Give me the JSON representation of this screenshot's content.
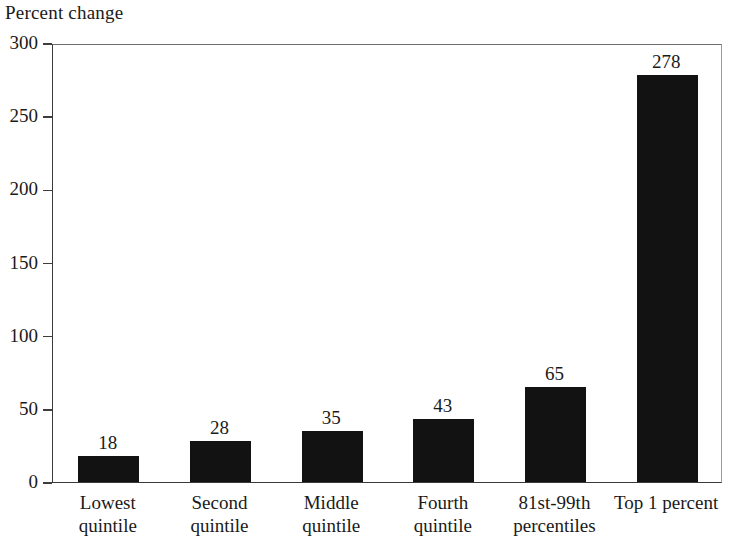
{
  "chart_data": {
    "type": "bar",
    "title": "Percent change",
    "xlabel": "",
    "ylabel": "Percent change",
    "categories": [
      "Lowest quintile",
      "Second quintile",
      "Middle quintile",
      "Fourth quintile",
      "81st-99th percentiles",
      "Top 1 percent"
    ],
    "category_lines": [
      [
        "Lowest",
        "quintile"
      ],
      [
        "Second",
        "quintile"
      ],
      [
        "Middle",
        "quintile"
      ],
      [
        "Fourth",
        "quintile"
      ],
      [
        "81st-99th",
        "percentiles"
      ],
      [
        "Top 1 percent"
      ]
    ],
    "values": [
      18,
      28,
      35,
      43,
      65,
      278
    ],
    "value_labels": [
      "18",
      "28",
      "35",
      "43",
      "65",
      "278"
    ],
    "ylim": [
      0,
      300
    ],
    "yticks": [
      0,
      50,
      100,
      150,
      200,
      250,
      300
    ],
    "ytick_labels": [
      "0",
      "50",
      "100",
      "150",
      "200",
      "250",
      "300"
    ],
    "grid": false,
    "legend": null,
    "bar_color": "#121212",
    "axis_color": "#3d3d3d"
  }
}
